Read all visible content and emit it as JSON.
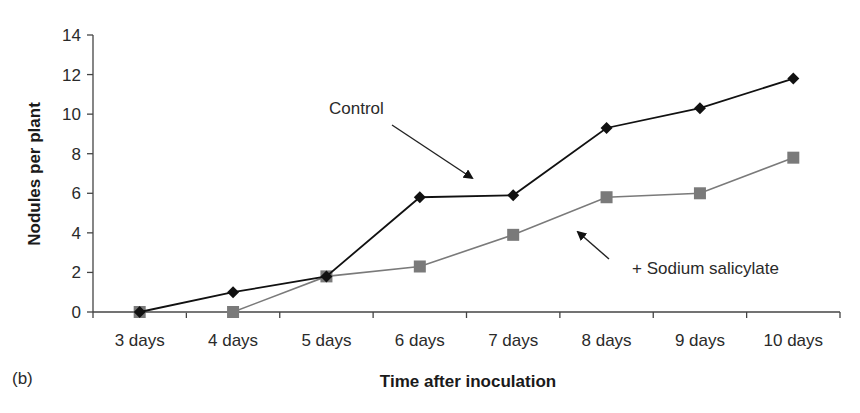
{
  "panel_label": "(b)",
  "chart_data": {
    "type": "line",
    "title": "",
    "xlabel": "Time after inoculation",
    "ylabel": "Nodules per plant",
    "ylim": [
      0,
      14
    ],
    "yticks": [
      0,
      2,
      4,
      6,
      8,
      10,
      12,
      14
    ],
    "grid": false,
    "legend_position": "none (inline annotations with arrows)",
    "categories": [
      "3 days",
      "4 days",
      "5 days",
      "6 days",
      "7 days",
      "8 days",
      "9 days",
      "10 days"
    ],
    "series": [
      {
        "name": "Control",
        "marker": "diamond",
        "color": "#111111",
        "values": [
          0,
          1.0,
          1.8,
          5.8,
          5.9,
          9.3,
          10.3,
          11.8
        ]
      },
      {
        "name": "+ Sodium salicylate",
        "marker": "square",
        "color": "#7a7a7a",
        "values": [
          0,
          0,
          1.8,
          2.3,
          3.9,
          5.8,
          6.0,
          7.8
        ]
      }
    ],
    "annotations": [
      {
        "text": "Control",
        "points_to": "Control"
      },
      {
        "text": "+ Sodium salicylate",
        "points_to": "+ Sodium salicylate"
      }
    ]
  }
}
